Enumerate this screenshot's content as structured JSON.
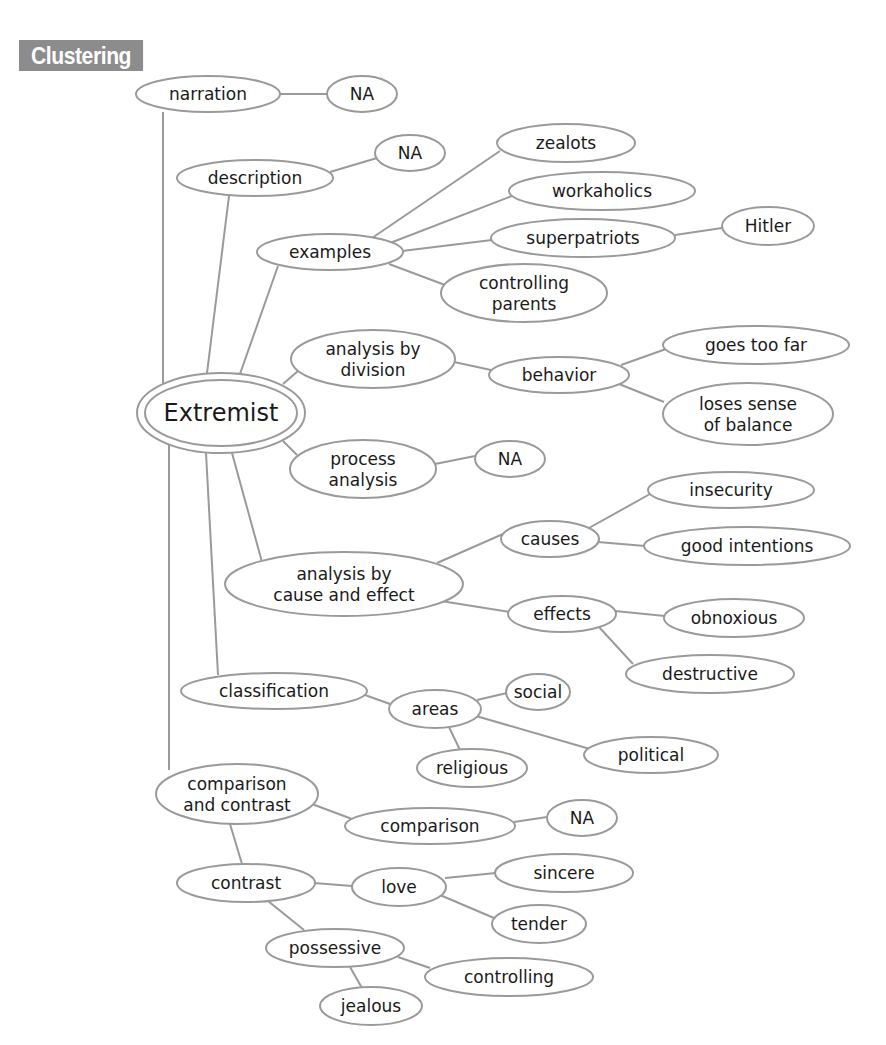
{
  "header": {
    "badge_label": "Clustering"
  },
  "diagram": {
    "type": "cluster-map",
    "colors": {
      "line": "#9a9a9a",
      "text": "#1a1a1a",
      "badge_bg": "#8c8c8c",
      "badge_text": "#ffffff"
    },
    "root": {
      "id": "extremist",
      "label": "Extremist"
    },
    "nodes": [
      {
        "id": "extremist",
        "lines": [
          "Extremist"
        ],
        "cx": 221,
        "cy": 413,
        "rx": 84,
        "ry": 40,
        "root": true
      },
      {
        "id": "narration",
        "lines": [
          "narration"
        ],
        "cx": 208,
        "cy": 94,
        "rx": 72,
        "ry": 18
      },
      {
        "id": "na1",
        "lines": [
          "NA"
        ],
        "cx": 362,
        "cy": 94,
        "rx": 35,
        "ry": 18
      },
      {
        "id": "description",
        "lines": [
          "description"
        ],
        "cx": 255,
        "cy": 178,
        "rx": 78,
        "ry": 18
      },
      {
        "id": "na2",
        "lines": [
          "NA"
        ],
        "cx": 410,
        "cy": 153,
        "rx": 35,
        "ry": 18
      },
      {
        "id": "examples",
        "lines": [
          "examples"
        ],
        "cx": 330,
        "cy": 252,
        "rx": 73,
        "ry": 18
      },
      {
        "id": "zealots",
        "lines": [
          "zealots"
        ],
        "cx": 566,
        "cy": 143,
        "rx": 69,
        "ry": 19
      },
      {
        "id": "workaholics",
        "lines": [
          "workaholics"
        ],
        "cx": 602,
        "cy": 191,
        "rx": 93,
        "ry": 19
      },
      {
        "id": "superpatriots",
        "lines": [
          "superpatriots"
        ],
        "cx": 583,
        "cy": 238,
        "rx": 92,
        "ry": 19
      },
      {
        "id": "hitler",
        "lines": [
          "Hitler"
        ],
        "cx": 768,
        "cy": 226,
        "rx": 46,
        "ry": 19
      },
      {
        "id": "controlling-parents",
        "lines": [
          "controlling",
          "parents"
        ],
        "cx": 524,
        "cy": 293,
        "rx": 83,
        "ry": 29
      },
      {
        "id": "analysis-by-division",
        "lines": [
          "analysis by",
          "division"
        ],
        "cx": 373,
        "cy": 359,
        "rx": 82,
        "ry": 29
      },
      {
        "id": "behavior",
        "lines": [
          "behavior"
        ],
        "cx": 559,
        "cy": 375,
        "rx": 70,
        "ry": 18
      },
      {
        "id": "goes-too-far",
        "lines": [
          "goes too far"
        ],
        "cx": 756,
        "cy": 345,
        "rx": 93,
        "ry": 19
      },
      {
        "id": "loses-sense",
        "lines": [
          "loses sense",
          "of balance"
        ],
        "cx": 748,
        "cy": 414,
        "rx": 85,
        "ry": 31
      },
      {
        "id": "process-analysis",
        "lines": [
          "process",
          "analysis"
        ],
        "cx": 363,
        "cy": 469,
        "rx": 73,
        "ry": 29
      },
      {
        "id": "na3",
        "lines": [
          "NA"
        ],
        "cx": 510,
        "cy": 459,
        "rx": 35,
        "ry": 18
      },
      {
        "id": "cause-effect",
        "lines": [
          "analysis by",
          "cause and effect"
        ],
        "cx": 344,
        "cy": 584,
        "rx": 119,
        "ry": 32
      },
      {
        "id": "causes",
        "lines": [
          "causes"
        ],
        "cx": 550,
        "cy": 539,
        "rx": 49,
        "ry": 18
      },
      {
        "id": "insecurity",
        "lines": [
          "insecurity"
        ],
        "cx": 731,
        "cy": 490,
        "rx": 83,
        "ry": 18
      },
      {
        "id": "good-intentions",
        "lines": [
          "good intentions"
        ],
        "cx": 747,
        "cy": 546,
        "rx": 103,
        "ry": 19
      },
      {
        "id": "effects",
        "lines": [
          "effects"
        ],
        "cx": 562,
        "cy": 614,
        "rx": 54,
        "ry": 18
      },
      {
        "id": "obnoxious",
        "lines": [
          "obnoxious"
        ],
        "cx": 734,
        "cy": 618,
        "rx": 70,
        "ry": 19
      },
      {
        "id": "destructive",
        "lines": [
          "destructive"
        ],
        "cx": 710,
        "cy": 674,
        "rx": 84,
        "ry": 19
      },
      {
        "id": "classification",
        "lines": [
          "classification"
        ],
        "cx": 274,
        "cy": 691,
        "rx": 93,
        "ry": 18
      },
      {
        "id": "areas",
        "lines": [
          "areas"
        ],
        "cx": 435,
        "cy": 709,
        "rx": 46,
        "ry": 19
      },
      {
        "id": "social",
        "lines": [
          "social"
        ],
        "cx": 538,
        "cy": 692,
        "rx": 32,
        "ry": 18
      },
      {
        "id": "political",
        "lines": [
          "political"
        ],
        "cx": 651,
        "cy": 755,
        "rx": 67,
        "ry": 18
      },
      {
        "id": "religious",
        "lines": [
          "religious"
        ],
        "cx": 472,
        "cy": 768,
        "rx": 55,
        "ry": 19
      },
      {
        "id": "comparison-contrast",
        "lines": [
          "comparison",
          "and contrast"
        ],
        "cx": 237,
        "cy": 794,
        "rx": 81,
        "ry": 30
      },
      {
        "id": "comparison",
        "lines": [
          "comparison"
        ],
        "cx": 430,
        "cy": 826,
        "rx": 85,
        "ry": 18
      },
      {
        "id": "na4",
        "lines": [
          "NA"
        ],
        "cx": 582,
        "cy": 818,
        "rx": 35,
        "ry": 18
      },
      {
        "id": "contrast",
        "lines": [
          "contrast"
        ],
        "cx": 246,
        "cy": 883,
        "rx": 69,
        "ry": 19
      },
      {
        "id": "love",
        "lines": [
          "love"
        ],
        "cx": 399,
        "cy": 887,
        "rx": 47,
        "ry": 19
      },
      {
        "id": "sincere",
        "lines": [
          "sincere"
        ],
        "cx": 564,
        "cy": 873,
        "rx": 69,
        "ry": 19
      },
      {
        "id": "tender",
        "lines": [
          "tender"
        ],
        "cx": 539,
        "cy": 924,
        "rx": 47,
        "ry": 19
      },
      {
        "id": "possessive",
        "lines": [
          "possessive"
        ],
        "cx": 335,
        "cy": 948,
        "rx": 69,
        "ry": 19
      },
      {
        "id": "controlling",
        "lines": [
          "controlling"
        ],
        "cx": 509,
        "cy": 977,
        "rx": 84,
        "ry": 19
      },
      {
        "id": "jealous",
        "lines": [
          "jealous"
        ],
        "cx": 371,
        "cy": 1006,
        "rx": 51,
        "ry": 19
      }
    ],
    "edges": [
      {
        "from": "narration",
        "to": "na1",
        "x1": 280,
        "y1": 94,
        "x2": 327,
        "y2": 94
      },
      {
        "from": "description",
        "to": "na2",
        "x1": 330,
        "y1": 172,
        "x2": 377,
        "y2": 158
      },
      {
        "from": "extremist",
        "to": "narration",
        "x1": 163,
        "y1": 384,
        "x2": 163,
        "y2": 112
      },
      {
        "from": "extremist",
        "to": "description",
        "x1": 207,
        "y1": 373,
        "x2": 229,
        "y2": 196
      },
      {
        "from": "extremist",
        "to": "examples",
        "x1": 240,
        "y1": 374,
        "x2": 278,
        "y2": 266
      },
      {
        "from": "examples",
        "to": "zealots",
        "x1": 372,
        "y1": 238,
        "x2": 500,
        "y2": 151
      },
      {
        "from": "examples",
        "to": "workaholics",
        "x1": 390,
        "y1": 243,
        "x2": 512,
        "y2": 196
      },
      {
        "from": "examples",
        "to": "superpatriots",
        "x1": 402,
        "y1": 251,
        "x2": 492,
        "y2": 240
      },
      {
        "from": "superpatriots",
        "to": "hitler",
        "x1": 675,
        "y1": 235,
        "x2": 722,
        "y2": 228
      },
      {
        "from": "examples",
        "to": "controlling-parents",
        "x1": 389,
        "y1": 264,
        "x2": 445,
        "y2": 285
      },
      {
        "from": "extremist",
        "to": "analysis-by-division",
        "x1": 283,
        "y1": 384,
        "x2": 298,
        "y2": 371
      },
      {
        "from": "analysis-by-division",
        "to": "behavior",
        "x1": 454,
        "y1": 362,
        "x2": 491,
        "y2": 370
      },
      {
        "from": "behavior",
        "to": "goes-too-far",
        "x1": 621,
        "y1": 365,
        "x2": 666,
        "y2": 349
      },
      {
        "from": "behavior",
        "to": "loses-sense",
        "x1": 619,
        "y1": 384,
        "x2": 664,
        "y2": 402
      },
      {
        "from": "extremist",
        "to": "process-analysis",
        "x1": 283,
        "y1": 441,
        "x2": 297,
        "y2": 455
      },
      {
        "from": "process-analysis",
        "to": "na3",
        "x1": 435,
        "y1": 464,
        "x2": 475,
        "y2": 456
      },
      {
        "from": "extremist",
        "to": "cause-effect",
        "x1": 232,
        "y1": 453,
        "x2": 262,
        "y2": 562
      },
      {
        "from": "cause-effect",
        "to": "causes",
        "x1": 437,
        "y1": 563,
        "x2": 503,
        "y2": 534
      },
      {
        "from": "causes",
        "to": "insecurity",
        "x1": 589,
        "y1": 528,
        "x2": 650,
        "y2": 494
      },
      {
        "from": "causes",
        "to": "good-intentions",
        "x1": 598,
        "y1": 542,
        "x2": 645,
        "y2": 546
      },
      {
        "from": "cause-effect",
        "to": "effects",
        "x1": 441,
        "y1": 601,
        "x2": 510,
        "y2": 612
      },
      {
        "from": "effects",
        "to": "obnoxious",
        "x1": 615,
        "y1": 611,
        "x2": 665,
        "y2": 616
      },
      {
        "from": "effects",
        "to": "destructive",
        "x1": 599,
        "y1": 627,
        "x2": 633,
        "y2": 664
      },
      {
        "from": "extremist",
        "to": "classification",
        "x1": 206,
        "y1": 453,
        "x2": 218,
        "y2": 675
      },
      {
        "from": "classification",
        "to": "areas",
        "x1": 365,
        "y1": 695,
        "x2": 390,
        "y2": 704
      },
      {
        "from": "areas",
        "to": "social",
        "x1": 477,
        "y1": 700,
        "x2": 507,
        "y2": 693
      },
      {
        "from": "areas",
        "to": "political",
        "x1": 476,
        "y1": 716,
        "x2": 590,
        "y2": 749
      },
      {
        "from": "areas",
        "to": "religious",
        "x1": 449,
        "y1": 727,
        "x2": 460,
        "y2": 750
      },
      {
        "from": "extremist",
        "to": "comparison-contrast",
        "x1": 169,
        "y1": 444,
        "x2": 169,
        "y2": 770
      },
      {
        "from": "comparison-contrast",
        "to": "comparison",
        "x1": 312,
        "y1": 804,
        "x2": 352,
        "y2": 819
      },
      {
        "from": "comparison",
        "to": "na4",
        "x1": 514,
        "y1": 822,
        "x2": 547,
        "y2": 817
      },
      {
        "from": "comparison-contrast",
        "to": "contrast",
        "x1": 230,
        "y1": 824,
        "x2": 242,
        "y2": 864
      },
      {
        "from": "contrast",
        "to": "love",
        "x1": 314,
        "y1": 883,
        "x2": 352,
        "y2": 886
      },
      {
        "from": "love",
        "to": "sincere",
        "x1": 445,
        "y1": 878,
        "x2": 496,
        "y2": 873
      },
      {
        "from": "love",
        "to": "tender",
        "x1": 440,
        "y1": 895,
        "x2": 494,
        "y2": 918
      },
      {
        "from": "contrast",
        "to": "possessive",
        "x1": 268,
        "y1": 901,
        "x2": 304,
        "y2": 930
      },
      {
        "from": "possessive",
        "to": "controlling",
        "x1": 398,
        "y1": 957,
        "x2": 430,
        "y2": 968
      },
      {
        "from": "possessive",
        "to": "jealous",
        "x1": 350,
        "y1": 967,
        "x2": 362,
        "y2": 988
      }
    ]
  }
}
